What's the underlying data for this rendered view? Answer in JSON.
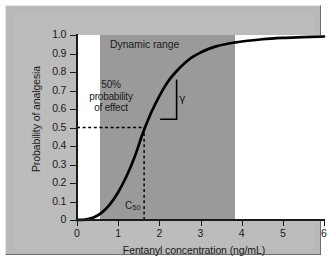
{
  "figure": {
    "background": "#bcbcbc",
    "plot_background_inside_band": "#9a9a9a",
    "plot_background_outside_band": "#ffffff",
    "curve_color": "#000000"
  },
  "chart_data": {
    "type": "line",
    "title": "",
    "xlabel": "Fentanyl concentration (ng/mL)",
    "ylabel": "Probability of analgesia",
    "xlim": [
      0,
      6
    ],
    "ylim": [
      0,
      1.0
    ],
    "xticks": [
      0,
      1,
      2,
      3,
      4,
      5,
      6
    ],
    "xtick_labels": [
      "0",
      "1",
      "2",
      "3",
      "4",
      "5",
      "6"
    ],
    "yticks": [
      0,
      0.1,
      0.2,
      0.3,
      0.4,
      0.5,
      0.6,
      0.7,
      0.8,
      0.9,
      1.0
    ],
    "ytick_labels": [
      "0",
      "0.1",
      "0.2",
      "0.3",
      "0.4",
      "0.5",
      "0.6",
      "0.7",
      "0.8",
      "0.9",
      "1.0"
    ],
    "grid": false,
    "legend": false,
    "series": [
      {
        "name": "Probability of analgesia",
        "model": "sigmoid Emax (Hill)",
        "c50": 1.63,
        "gamma": 3.3,
        "x": [
          0,
          0.2,
          0.4,
          0.6,
          0.8,
          1.0,
          1.2,
          1.4,
          1.6,
          1.8,
          2.0,
          2.2,
          2.4,
          2.6,
          2.8,
          3.0,
          3.2,
          3.4,
          3.6,
          3.8,
          4.0,
          4.5,
          5.0,
          5.5,
          6.0
        ],
        "values": [
          0.0,
          0.002,
          0.013,
          0.04,
          0.085,
          0.15,
          0.235,
          0.34,
          0.47,
          0.58,
          0.67,
          0.745,
          0.8,
          0.845,
          0.88,
          0.905,
          0.925,
          0.94,
          0.95,
          0.958,
          0.965,
          0.977,
          0.984,
          0.988,
          0.992
        ]
      }
    ],
    "annotations": {
      "dynamic_range_label": "Dynamic range",
      "dynamic_range_x_start": 0.55,
      "dynamic_range_x_end": 3.85,
      "fifty_percent_label_lines": [
        "50%",
        "probability",
        "of effect"
      ],
      "gamma_symbol": "γ",
      "c50_label": "C",
      "c50_subscript": "50",
      "c50_value_x": 1.63,
      "c50_value_y": 0.5,
      "reference_lines": [
        {
          "name": "half-effect-horizontal",
          "y": 0.5,
          "style": "dashed",
          "x_from": 0,
          "x_to": 1.63
        },
        {
          "name": "c50-vertical",
          "x": 1.63,
          "style": "dashed",
          "y_from": 0,
          "y_to": 0.5
        }
      ],
      "slope_triangle": {
        "name": "gamma-slope-triangle",
        "x_left": 2.02,
        "x_right": 2.42,
        "y_bottom": 0.545,
        "y_top": 0.76
      }
    }
  }
}
